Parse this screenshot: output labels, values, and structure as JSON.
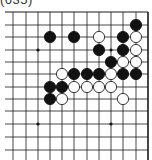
{
  "problem": {
    "title": "(635)"
  },
  "board": {
    "grid_x": [
      1,
      13,
      26,
      38,
      50,
      62,
      74,
      87,
      99,
      111,
      123,
      136,
      148
    ],
    "grid_y": [
      12,
      25,
      37,
      50,
      62,
      74,
      87,
      99,
      111,
      124,
      137,
      150,
      162
    ],
    "top_edge": true,
    "right_edge": true,
    "line_color": "#1a1a1a",
    "star_points": [
      [
        38,
        50
      ],
      [
        111,
        50
      ],
      [
        38,
        124
      ],
      [
        111,
        124
      ]
    ],
    "stone_radius": 5.6,
    "stones": [
      {
        "color": "black",
        "x": 136,
        "y": 25
      },
      {
        "color": "black",
        "x": 50,
        "y": 37
      },
      {
        "color": "black",
        "x": 74,
        "y": 37
      },
      {
        "color": "white",
        "x": 99,
        "y": 37
      },
      {
        "color": "black",
        "x": 123,
        "y": 37
      },
      {
        "color": "white",
        "x": 136,
        "y": 37
      },
      {
        "color": "black",
        "x": 99,
        "y": 50
      },
      {
        "color": "black",
        "x": 123,
        "y": 50
      },
      {
        "color": "white",
        "x": 136,
        "y": 50
      },
      {
        "color": "black",
        "x": 111,
        "y": 62
      },
      {
        "color": "white",
        "x": 123,
        "y": 62
      },
      {
        "color": "white",
        "x": 136,
        "y": 62
      },
      {
        "color": "white",
        "x": 62,
        "y": 74
      },
      {
        "color": "black",
        "x": 74,
        "y": 74
      },
      {
        "color": "black",
        "x": 87,
        "y": 74
      },
      {
        "color": "black",
        "x": 99,
        "y": 74
      },
      {
        "color": "white",
        "x": 111,
        "y": 74
      },
      {
        "color": "black",
        "x": 123,
        "y": 74
      },
      {
        "color": "black",
        "x": 136,
        "y": 74
      },
      {
        "color": "black",
        "x": 50,
        "y": 87
      },
      {
        "color": "black",
        "x": 62,
        "y": 87
      },
      {
        "color": "white",
        "x": 74,
        "y": 87
      },
      {
        "color": "white",
        "x": 87,
        "y": 87
      },
      {
        "color": "white",
        "x": 99,
        "y": 87
      },
      {
        "color": "white",
        "x": 111,
        "y": 87
      },
      {
        "color": "black",
        "x": 50,
        "y": 99
      },
      {
        "color": "white",
        "x": 62,
        "y": 99
      },
      {
        "color": "white",
        "x": 123,
        "y": 99
      }
    ]
  }
}
